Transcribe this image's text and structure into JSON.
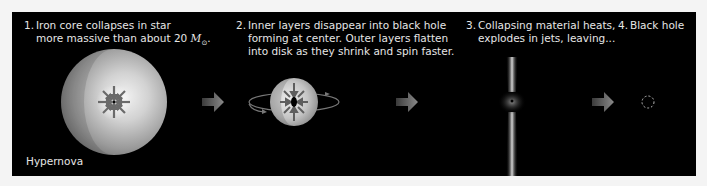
{
  "steps": [
    {
      "number": "1.",
      "line1": "Iron core collapses in star",
      "line2_prefix": "more massive than about 20 ",
      "line2_symbol": "M",
      "line2_subscript": "⊙",
      "line2_suffix": ".",
      "illustration": "star-sphere-collapsing-core"
    },
    {
      "number": "2.",
      "line1": "Inner layers disappear into black hole",
      "line2": "forming at center. Outer layers flatten",
      "line3": "into disk as they shrink and spin faster.",
      "illustration": "flattened-spinning-disk"
    },
    {
      "number": "3.",
      "line1": "Collapsing material heats,",
      "line2": "explodes in jets, leaving...",
      "illustration": "bipolar-jets"
    },
    {
      "number": "4.",
      "line1": "Black hole",
      "illustration": "black-hole-dashed-circle"
    }
  ],
  "labels": {
    "hypernova": "Hypernova"
  },
  "colors": {
    "panel_background": "#000000",
    "page_background": "#f4f4f4",
    "text": "#e6e6e6",
    "arrow": "#6f6f6f"
  }
}
